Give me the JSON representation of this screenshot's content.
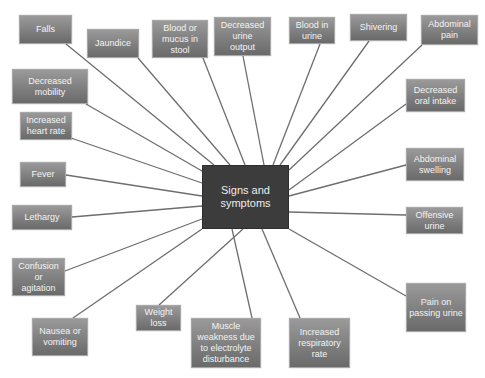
{
  "diagram": {
    "center": {
      "label": "Signs and\nsymptoms",
      "x": 202,
      "y": 165,
      "w": 87,
      "h": 64,
      "color": "#3c3c3c"
    },
    "line_color": "#6e6e6e",
    "node_color": "#808080",
    "nodes": [
      {
        "id": "falls",
        "label": "Falls",
        "x": 19,
        "y": 15,
        "w": 53,
        "h": 29,
        "anchor": [
          66,
          44
        ]
      },
      {
        "id": "jaundice",
        "label": "Jaundice",
        "x": 87,
        "y": 29,
        "w": 52,
        "h": 29,
        "anchor": [
          138,
          58
        ]
      },
      {
        "id": "blood-mucus-stool",
        "label": "Blood or\nmucus in\nstool",
        "x": 152,
        "y": 20,
        "w": 56,
        "h": 38,
        "anchor": [
          203,
          58
        ]
      },
      {
        "id": "decreased-urine-output",
        "label": "Decreased\nurine\noutput",
        "x": 214,
        "y": 17,
        "w": 57,
        "h": 39,
        "anchor": [
          243,
          56
        ]
      },
      {
        "id": "blood-in-urine",
        "label": "Blood in\nurine",
        "x": 289,
        "y": 17,
        "w": 46,
        "h": 27,
        "anchor": [
          320,
          44
        ]
      },
      {
        "id": "shivering",
        "label": "Shivering",
        "x": 350,
        "y": 14,
        "w": 57,
        "h": 27,
        "anchor": [
          369,
          41
        ]
      },
      {
        "id": "abdominal-pain",
        "label": "Abdominal\npain",
        "x": 421,
        "y": 15,
        "w": 57,
        "h": 30,
        "anchor": [
          422,
          45
        ]
      },
      {
        "id": "decreased-mobility",
        "label": "Decreased\nmobility",
        "x": 12,
        "y": 69,
        "w": 76,
        "h": 35,
        "anchor": [
          86,
          104
        ]
      },
      {
        "id": "decreased-oral-intake",
        "label": "Decreased\noral intake",
        "x": 406,
        "y": 79,
        "w": 59,
        "h": 33,
        "anchor": [
          406,
          104
        ]
      },
      {
        "id": "increased-heart-rate",
        "label": "Increased\nheart rate",
        "x": 20,
        "y": 112,
        "w": 52,
        "h": 28,
        "anchor": [
          71,
          138
        ]
      },
      {
        "id": "fever",
        "label": "Fever",
        "x": 20,
        "y": 162,
        "w": 46,
        "h": 25,
        "anchor": [
          66,
          175
        ]
      },
      {
        "id": "abdominal-swelling",
        "label": "Abdominal\nswelling",
        "x": 406,
        "y": 148,
        "w": 58,
        "h": 33,
        "anchor": [
          406,
          165
        ]
      },
      {
        "id": "lethargy",
        "label": "Lethargy",
        "x": 12,
        "y": 205,
        "w": 60,
        "h": 25,
        "anchor": [
          72,
          217
        ]
      },
      {
        "id": "offensive-urine",
        "label": "Offensive\nurine",
        "x": 406,
        "y": 207,
        "w": 57,
        "h": 27,
        "anchor": [
          406,
          215
        ]
      },
      {
        "id": "confusion-agitation",
        "label": "Confusion\nor\nagitation",
        "x": 12,
        "y": 258,
        "w": 53,
        "h": 38,
        "anchor": [
          65,
          271
        ]
      },
      {
        "id": "pain-passing-urine",
        "label": "Pain on\npassing urine",
        "x": 406,
        "y": 283,
        "w": 60,
        "h": 49,
        "anchor": [
          406,
          296
        ]
      },
      {
        "id": "weight-loss",
        "label": "Weight\nloss",
        "x": 136,
        "y": 305,
        "w": 45,
        "h": 26,
        "anchor": [
          159,
          305
        ]
      },
      {
        "id": "nausea-vomiting",
        "label": "Nausea or\nvomiting",
        "x": 32,
        "y": 318,
        "w": 56,
        "h": 38,
        "anchor": [
          73,
          318
        ]
      },
      {
        "id": "muscle-weakness",
        "label": "Muscle\nweakness due\nto electrolyte\ndisturbance",
        "x": 191,
        "y": 318,
        "w": 70,
        "h": 50,
        "anchor": [
          252,
          318
        ]
      },
      {
        "id": "increased-respiratory-rate",
        "label": "Increased\nrespiratory\nrate",
        "x": 289,
        "y": 318,
        "w": 61,
        "h": 50,
        "anchor": [
          300,
          318
        ]
      }
    ],
    "center_endpoints": [
      [
        214,
        165
      ],
      [
        230,
        165
      ],
      [
        245,
        165
      ],
      [
        264,
        165
      ],
      [
        273,
        165
      ],
      [
        280,
        165
      ],
      [
        289,
        170
      ],
      [
        202,
        171
      ],
      [
        289,
        190
      ],
      [
        202,
        183
      ],
      [
        202,
        196
      ],
      [
        289,
        196
      ],
      [
        202,
        206
      ],
      [
        289,
        212
      ],
      [
        202,
        219
      ],
      [
        289,
        229
      ],
      [
        243,
        229
      ],
      [
        202,
        229
      ],
      [
        232,
        229
      ],
      [
        262,
        229
      ]
    ]
  }
}
